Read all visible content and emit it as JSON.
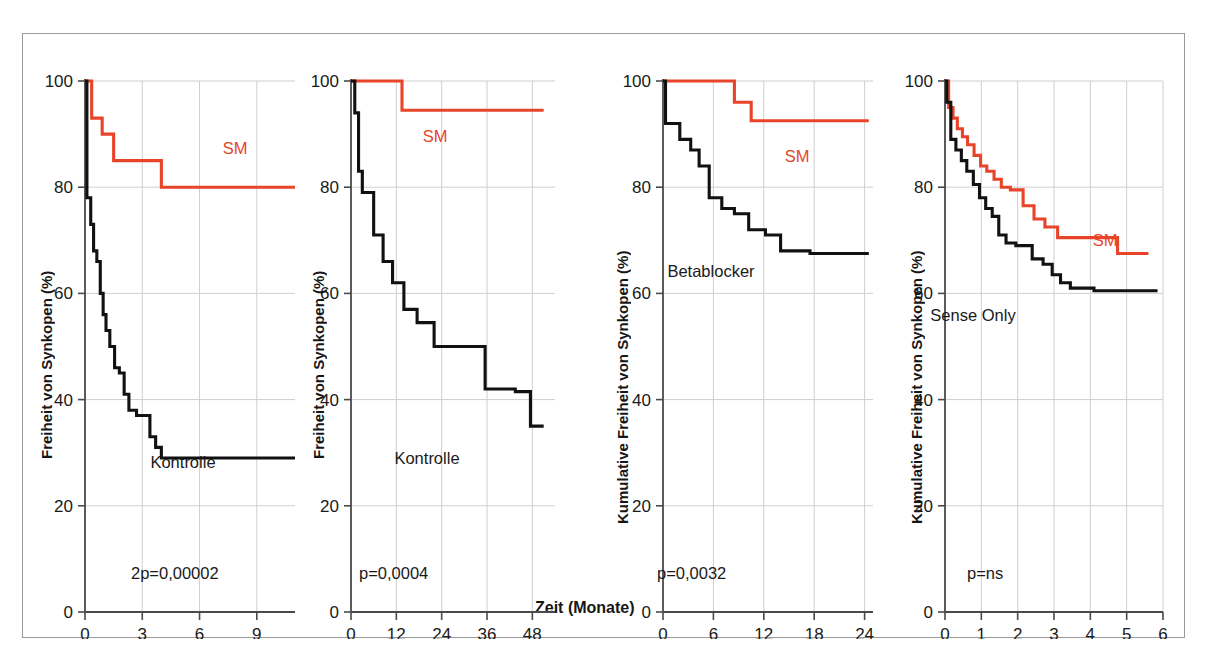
{
  "figure": {
    "shared_xlabel": "Zeit (Monate)",
    "series_colors": {
      "sm": "#e8442a",
      "control": "#111111"
    }
  },
  "chart_data": [
    {
      "type": "line",
      "panel_index": 1,
      "title": "",
      "xlabel": "Zeit (Monate)",
      "ylabel": "Freiheit von Synkopen (%)",
      "xlim": [
        0,
        11
      ],
      "ylim": [
        0,
        100
      ],
      "xticks": [
        0,
        3,
        6,
        9
      ],
      "yticks": [
        0,
        20,
        40,
        60,
        80,
        100
      ],
      "grid": true,
      "annotation": "2p = 0,00002",
      "annotation_raw": "2p=0,00002",
      "series": [
        {
          "name": "SM",
          "label": "SM",
          "color": "#e8442a",
          "step": "post",
          "x": [
            0,
            0.35,
            0.35,
            0.9,
            0.9,
            1.5,
            1.5,
            4.0,
            4.0,
            11.0
          ],
          "y": [
            100,
            100,
            93,
            93,
            90,
            90,
            85,
            85,
            80,
            80
          ]
        },
        {
          "name": "Kontrolle",
          "label": "Kontrolle",
          "color": "#111111",
          "step": "post",
          "x": [
            0,
            0.1,
            0.1,
            0.3,
            0.3,
            0.45,
            0.45,
            0.62,
            0.62,
            0.8,
            0.8,
            0.95,
            0.95,
            1.1,
            1.1,
            1.3,
            1.3,
            1.55,
            1.55,
            1.8,
            1.8,
            2.05,
            2.05,
            2.3,
            2.3,
            2.7,
            2.7,
            3.4,
            3.4,
            3.7,
            3.7,
            4.0,
            4.0,
            11.0
          ],
          "y": [
            100,
            100,
            78,
            78,
            73,
            73,
            68,
            68,
            66,
            66,
            60,
            60,
            56,
            56,
            53,
            53,
            50,
            50,
            46,
            46,
            45,
            45,
            41,
            41,
            38,
            38,
            37,
            37,
            33,
            33,
            31,
            31,
            29,
            29
          ]
        }
      ]
    },
    {
      "type": "line",
      "panel_index": 2,
      "title": "",
      "xlabel": "Zeit (Monate)",
      "ylabel": "Freiheit von Synkopen (%)",
      "xlim": [
        0,
        54
      ],
      "ylim": [
        0,
        100
      ],
      "xticks": [
        0,
        12,
        24,
        36,
        48
      ],
      "yticks": [
        0,
        20,
        40,
        60,
        80,
        100
      ],
      "grid": true,
      "annotation": "p = 0,0004",
      "annotation_raw": "p=0,0004",
      "series": [
        {
          "name": "SM",
          "label": "SM",
          "color": "#e8442a",
          "step": "post",
          "x": [
            0,
            13.5,
            13.5,
            51.0
          ],
          "y": [
            100,
            100,
            94.5,
            94.5
          ]
        },
        {
          "name": "Kontrolle",
          "label": "Kontrolle",
          "color": "#111111",
          "step": "post",
          "x": [
            0,
            1.0,
            1.0,
            2.0,
            2.0,
            3.0,
            3.0,
            6.0,
            6.0,
            8.5,
            8.5,
            11.0,
            11.0,
            14.0,
            14.0,
            17.5,
            17.5,
            22.0,
            22.0,
            35.5,
            35.5,
            43.5,
            43.5,
            47.5,
            47.5,
            51.0
          ],
          "y": [
            100,
            100,
            94,
            94,
            83,
            83,
            79,
            79,
            71,
            71,
            66,
            66,
            62,
            62,
            57,
            57,
            54.5,
            54.5,
            50,
            50,
            42,
            42,
            41.5,
            41.5,
            35,
            35,
            25
          ]
        }
      ]
    },
    {
      "type": "line",
      "panel_index": 3,
      "title": "",
      "xlabel": "Zeit (Monate)",
      "ylabel": "Kumulative Freiheit von Synkopen (%)",
      "xlim": [
        0,
        25
      ],
      "ylim": [
        0,
        100
      ],
      "xticks": [
        0,
        6,
        12,
        18,
        24
      ],
      "yticks": [
        0,
        20,
        40,
        60,
        80,
        100
      ],
      "grid": true,
      "annotation": "p = 0,0032",
      "annotation_raw": "p=0,0032",
      "series": [
        {
          "name": "SM",
          "label": "SM",
          "color": "#e8442a",
          "step": "post",
          "x": [
            0,
            8.5,
            8.5,
            10.5,
            10.5,
            24.5
          ],
          "y": [
            100,
            100,
            96,
            96,
            92.5,
            92.5
          ]
        },
        {
          "name": "Betablocker",
          "label": "Betablocker",
          "color": "#111111",
          "step": "post",
          "x": [
            0,
            0.3,
            0.3,
            2.0,
            2.0,
            3.3,
            3.3,
            4.3,
            4.3,
            5.5,
            5.5,
            7.0,
            7.0,
            8.5,
            8.5,
            10.2,
            10.2,
            12.2,
            12.2,
            14.0,
            14.0,
            17.5,
            17.5,
            24.5
          ],
          "y": [
            100,
            100,
            92,
            92,
            89,
            89,
            87,
            87,
            84,
            84,
            78,
            78,
            76,
            76,
            75,
            75,
            72,
            72,
            71,
            71,
            68,
            68,
            67.5,
            67.5
          ]
        }
      ]
    },
    {
      "type": "line",
      "panel_index": 4,
      "title": "",
      "xlabel": "Zeit (Monate)",
      "ylabel": "Kumulative Freiheit von Synkopen (%)",
      "xlim": [
        0,
        6
      ],
      "ylim": [
        0,
        100
      ],
      "xticks": [
        0,
        1,
        2,
        3,
        4,
        5,
        6
      ],
      "yticks": [
        0,
        20,
        40,
        60,
        80,
        100
      ],
      "grid": true,
      "annotation": "p = ns",
      "annotation_raw": "p=ns",
      "series": [
        {
          "name": "SM",
          "label": "SM",
          "color": "#e8442a",
          "step": "post",
          "x": [
            0,
            0.1,
            0.1,
            0.22,
            0.22,
            0.34,
            0.34,
            0.48,
            0.48,
            0.62,
            0.62,
            0.8,
            0.8,
            0.98,
            0.98,
            1.15,
            1.15,
            1.35,
            1.35,
            1.55,
            1.55,
            1.8,
            1.8,
            2.15,
            2.15,
            2.45,
            2.45,
            2.75,
            2.75,
            3.1,
            3.1,
            4.75,
            4.75,
            5.6
          ],
          "y": [
            100,
            100,
            95,
            95,
            93,
            93,
            91,
            91,
            89.5,
            89.5,
            88,
            88,
            86,
            86,
            84,
            84,
            83,
            83,
            81.5,
            81.5,
            80,
            80,
            79.5,
            79.5,
            76.5,
            76.5,
            74,
            74,
            72.5,
            72.5,
            70.5,
            70.5,
            67.5,
            67.5
          ]
        },
        {
          "name": "Sense Only",
          "label": "Sense Only",
          "color": "#111111",
          "step": "post",
          "x": [
            0,
            0.05,
            0.05,
            0.16,
            0.16,
            0.3,
            0.3,
            0.45,
            0.45,
            0.6,
            0.6,
            0.78,
            0.78,
            0.95,
            0.95,
            1.12,
            1.12,
            1.3,
            1.3,
            1.48,
            1.48,
            1.68,
            1.68,
            1.95,
            1.95,
            2.4,
            2.4,
            2.7,
            2.7,
            2.95,
            2.95,
            3.18,
            3.18,
            3.45,
            3.45,
            4.1,
            4.1,
            5.85
          ],
          "y": [
            100,
            100,
            96,
            96,
            89,
            89,
            87,
            87,
            85,
            85,
            83,
            83,
            80.5,
            80.5,
            78,
            78,
            76,
            76,
            74.5,
            74.5,
            71,
            71,
            69.5,
            69.5,
            69,
            69,
            66.5,
            66.5,
            65.5,
            65.5,
            63.5,
            63.5,
            62,
            62,
            61,
            61,
            60.5,
            60.5
          ]
        }
      ]
    }
  ]
}
